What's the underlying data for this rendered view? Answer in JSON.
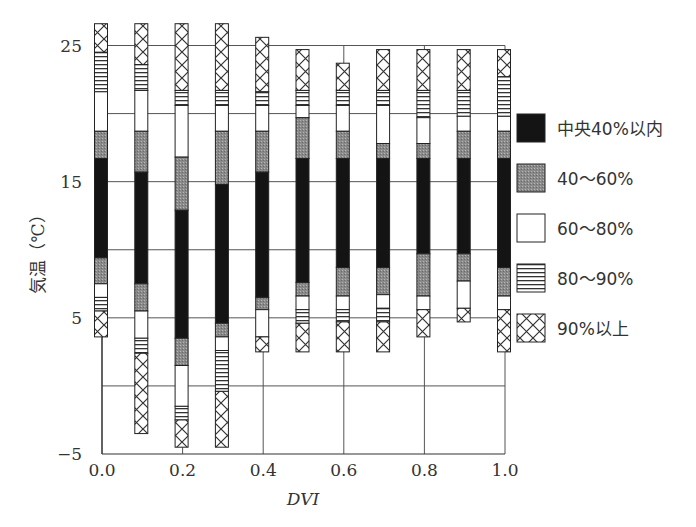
{
  "chart_data": {
    "type": "bar",
    "subtype": "stacked-range (percentile bands)",
    "title": "",
    "xlabel": "DVI",
    "ylabel": "気温（℃）",
    "xlim": [
      0.0,
      1.0
    ],
    "ylim": [
      -5,
      25
    ],
    "x_ticks": [
      "0.0",
      "0.2",
      "0.4",
      "0.6",
      "0.8",
      "1.0"
    ],
    "y_ticks": [
      "25",
      "15",
      "5",
      "−5"
    ],
    "grid": {
      "horizontal": [
        25,
        20,
        15,
        10,
        5,
        0
      ],
      "vertical": [
        0.0,
        0.2,
        0.4,
        0.6,
        0.8,
        1.0
      ]
    },
    "legend": {
      "position": "right",
      "entries": [
        {
          "key": "central40",
          "label": "中央40%以内",
          "fill": "black"
        },
        {
          "key": "p40_60",
          "label": "40～60%",
          "fill": "gray-dots"
        },
        {
          "key": "p60_80",
          "label": "60～80%",
          "fill": "white"
        },
        {
          "key": "p80_90",
          "label": "80～90%",
          "fill": "horizontal-stripes"
        },
        {
          "key": "p90plus",
          "label": "90%以上",
          "fill": "crosshatch"
        }
      ]
    },
    "band_order_top_to_bottom": [
      "p90plus",
      "p80_90",
      "p60_80",
      "p40_60",
      "central40",
      "p40_60",
      "p60_80",
      "p80_90",
      "p90plus"
    ],
    "x": [
      0.0,
      0.1,
      0.2,
      0.3,
      0.4,
      0.5,
      0.6,
      0.7,
      0.8,
      0.9,
      1.0
    ],
    "boundaries_note": "Each bar lists temperature boundaries (°C) from top to bottom; segments between consecutive boundaries follow band_order_top_to_bottom. Null-width segments are omitted by equal consecutive values.",
    "bars": [
      {
        "x": 0.0,
        "boundaries": [
          26.6,
          24.5,
          21.6,
          18.7,
          16.7,
          9.4,
          7.5,
          6.5,
          5.5,
          3.6
        ]
      },
      {
        "x": 0.1,
        "boundaries": [
          26.6,
          23.6,
          21.7,
          18.7,
          15.7,
          7.5,
          5.5,
          3.5,
          2.4,
          -3.5
        ]
      },
      {
        "x": 0.2,
        "boundaries": [
          26.6,
          21.7,
          20.6,
          16.8,
          12.9,
          3.5,
          1.5,
          -1.5,
          -2.5,
          -4.5
        ]
      },
      {
        "x": 0.3,
        "boundaries": [
          26.6,
          21.7,
          20.6,
          18.7,
          14.8,
          4.6,
          3.6,
          2.6,
          -0.4,
          -4.5
        ]
      },
      {
        "x": 0.4,
        "boundaries": [
          25.6,
          21.6,
          20.6,
          18.7,
          15.7,
          6.5,
          5.6,
          3.6,
          3.6,
          2.5
        ]
      },
      {
        "x": 0.5,
        "boundaries": [
          24.7,
          21.7,
          20.6,
          19.7,
          16.7,
          7.6,
          6.6,
          5.6,
          4.6,
          2.5
        ]
      },
      {
        "x": 0.6,
        "boundaries": [
          23.7,
          21.7,
          20.6,
          18.7,
          16.7,
          8.7,
          6.6,
          5.6,
          4.7,
          2.5
        ]
      },
      {
        "x": 0.7,
        "boundaries": [
          24.7,
          21.7,
          20.6,
          17.8,
          16.7,
          8.7,
          6.7,
          5.7,
          4.7,
          2.5
        ]
      },
      {
        "x": 0.8,
        "boundaries": [
          24.7,
          21.7,
          19.7,
          17.8,
          16.7,
          9.7,
          6.6,
          5.6,
          5.6,
          3.6
        ]
      },
      {
        "x": 0.9,
        "boundaries": [
          24.7,
          21.7,
          19.8,
          18.7,
          16.7,
          9.7,
          7.7,
          5.7,
          5.7,
          4.7
        ]
      },
      {
        "x": 1.0,
        "boundaries": [
          24.7,
          22.7,
          19.8,
          18.7,
          16.7,
          8.7,
          6.6,
          5.6,
          5.6,
          2.5
        ]
      }
    ]
  }
}
